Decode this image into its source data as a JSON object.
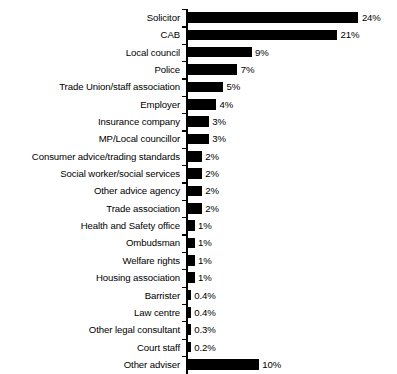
{
  "chart_data": {
    "type": "bar",
    "orientation": "horizontal",
    "title": "",
    "subtitle": "",
    "xlabel": "",
    "ylabel": "",
    "grid": false,
    "legend": null,
    "axis": {
      "value_axis_visible": false,
      "category_axis_visible": true,
      "xlim": [
        0,
        24
      ]
    },
    "categories": [
      "Solicitor",
      "CAB",
      "Local council",
      "Police",
      "Trade Union/staff association",
      "Employer",
      "Insurance company",
      "MP/Local councillor",
      "Consumer advice/trading standards",
      "Social worker/social services",
      "Other advice agency",
      "Trade association",
      "Health and Safety office",
      "Ombudsman",
      "Welfare rights",
      "Housing association",
      "Barrister",
      "Law centre",
      "Other legal consultant",
      "Court staff",
      "Other adviser"
    ],
    "values": [
      24,
      21,
      9,
      7,
      5,
      4,
      3,
      3,
      2,
      2,
      2,
      2,
      1,
      1,
      1,
      1,
      0.4,
      0.4,
      0.3,
      0.2,
      10
    ],
    "data_labels": [
      "24%",
      "21%",
      "9%",
      "7%",
      "5%",
      "4%",
      "3%",
      "3%",
      "2%",
      "2%",
      "2%",
      "2%",
      "1%",
      "1%",
      "1%",
      "1%",
      "0.4%",
      "0.4%",
      "0.3%",
      "0.2%",
      "10%"
    ],
    "colors": {
      "bar": "#000000",
      "axis": "#000000",
      "text": "#000000",
      "background": "#ffffff"
    }
  }
}
